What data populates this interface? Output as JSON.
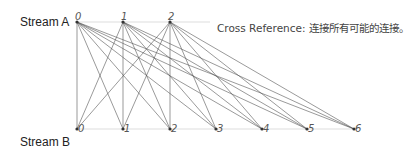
{
  "diagram": {
    "stream_a": {
      "label": "Stream A",
      "nodes": [
        {
          "id": "0",
          "x": 77,
          "y": 22
        },
        {
          "id": "1",
          "x": 123,
          "y": 22
        },
        {
          "id": "2",
          "x": 170,
          "y": 22
        }
      ]
    },
    "stream_b": {
      "label": "Stream B",
      "nodes": [
        {
          "id": "0",
          "x": 77,
          "y": 129
        },
        {
          "id": "1",
          "x": 123,
          "y": 129
        },
        {
          "id": "2",
          "x": 170,
          "y": 129
        },
        {
          "id": "3",
          "x": 216,
          "y": 129
        },
        {
          "id": "4",
          "x": 262,
          "y": 129
        },
        {
          "id": "5",
          "x": 307,
          "y": 129
        },
        {
          "id": "6",
          "x": 354,
          "y": 129
        }
      ]
    },
    "caption": "Cross Reference: 连接所有可能的连接。",
    "edge_color": "#555555",
    "baseline_color": "#dddddd"
  }
}
